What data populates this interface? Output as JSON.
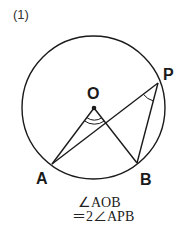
{
  "problem_number": "(1)",
  "points": {
    "O": {
      "label": "O",
      "x": 94,
      "y": 108
    },
    "A": {
      "label": "A",
      "x": 52,
      "y": 164
    },
    "B": {
      "label": "B",
      "x": 137,
      "y": 163
    },
    "P": {
      "label": "P",
      "x": 158,
      "y": 83
    }
  },
  "circle": {
    "cx": 93.5,
    "cy": 107.5,
    "r": 71.5
  },
  "formula": {
    "line1": "∠AOB",
    "line2": "＝2∠APB"
  },
  "colors": {
    "stroke": "#1a1a1a",
    "background": "#ffffff"
  }
}
